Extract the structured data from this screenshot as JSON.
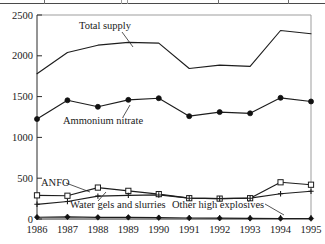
{
  "figure": {
    "top_rule_name": "table-bottom-rule",
    "background": "#ffffff",
    "line_color": "#1d1d1d"
  },
  "chart_data": {
    "type": "line",
    "title": "",
    "xlabel": "",
    "ylabel": "",
    "grid": false,
    "legend": "inline-annotations",
    "xlim": [
      1986,
      1995
    ],
    "ylim": [
      0,
      2500
    ],
    "yticks": [
      0,
      500,
      1000,
      1500,
      2000,
      2500
    ],
    "ytick_labels": [
      "0",
      "500",
      "1000",
      "1500",
      "2000",
      "2500"
    ],
    "categories": [
      1986,
      1987,
      1988,
      1989,
      1990,
      1991,
      1992,
      1993,
      1994,
      1995
    ],
    "xtick_labels": [
      "1986",
      "1987",
      "1988",
      "1989",
      "1990",
      "1991",
      "1992",
      "1993",
      "1994",
      "1995"
    ],
    "series": [
      {
        "name": "Total supply",
        "label": "Total  supply",
        "marker": "none",
        "values": [
          1780,
          2040,
          2130,
          2165,
          2155,
          1845,
          1885,
          1870,
          2310,
          2270
        ]
      },
      {
        "name": "Ammonium nitrate",
        "label": "Ammonium nitrate",
        "marker": "filled-circle",
        "values": [
          1225,
          1455,
          1375,
          1460,
          1480,
          1260,
          1310,
          1295,
          1485,
          1440
        ]
      },
      {
        "name": "ANFO",
        "label": "ANFO",
        "marker": "open-square",
        "values": [
          290,
          285,
          385,
          345,
          305,
          255,
          250,
          255,
          450,
          420
        ]
      },
      {
        "name": "Water gels and slurries",
        "label": "Water gels and slurries",
        "marker": "plus",
        "values": [
          180,
          215,
          280,
          290,
          295,
          255,
          250,
          255,
          310,
          340
        ]
      },
      {
        "name": "Other high explosives",
        "label": "Other high explosives",
        "marker": "filled-diamond",
        "values": [
          22,
          26,
          20,
          20,
          16,
          12,
          10,
          8,
          6,
          6
        ]
      }
    ],
    "annotations": [
      {
        "text": "Total  supply",
        "series": "Total supply"
      },
      {
        "text": "Ammonium nitrate",
        "series": "Ammonium nitrate"
      },
      {
        "text": "ANFO",
        "series": "ANFO"
      },
      {
        "text": "Water gels and slurries",
        "series": "Water gels and slurries"
      },
      {
        "text": "Other high explosives",
        "series": "Other high explosives"
      }
    ]
  }
}
